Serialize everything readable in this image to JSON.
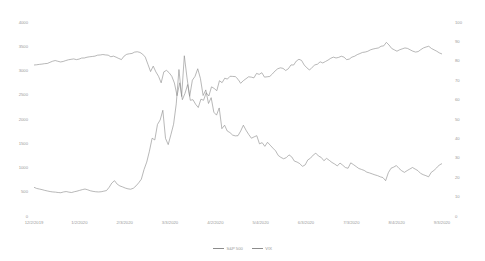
{
  "chart_data": {
    "type": "line",
    "title": "",
    "xlabel": "",
    "ylabel": "",
    "y2label": "",
    "grid": false,
    "legend_position": "bottom-center",
    "line_color": "#8c8c8c",
    "axis_text_color": "#9a9a9a",
    "x_tick_labels": [
      "12/2/2019",
      "1/2/2020",
      "2/3/2020",
      "3/3/2020",
      "4/2/2020",
      "5/4/2020",
      "6/3/2020",
      "7/3/2020",
      "8/4/2020",
      "9/3/2020"
    ],
    "y_left_ticks": [
      "4000",
      "3500",
      "3000",
      "2500",
      "2000",
      "1500",
      "1000",
      "500",
      "0"
    ],
    "y_left_lim": [
      0,
      4000
    ],
    "y_right_ticks": [
      "100",
      "90",
      "80",
      "70",
      "60",
      "50",
      "40",
      "30",
      "20",
      "10",
      "0"
    ],
    "y_right_lim": [
      0,
      100
    ],
    "series": [
      {
        "name": "S&P 500",
        "axis": "left",
        "values": [
          3113,
          3118,
          3126,
          3132,
          3141,
          3145,
          3168,
          3191,
          3205,
          3191,
          3176,
          3186,
          3205,
          3221,
          3230,
          3239,
          3224,
          3235,
          3257,
          3258,
          3274,
          3283,
          3289,
          3296,
          3316,
          3320,
          3329,
          3321,
          3316,
          3283,
          3296,
          3274,
          3248,
          3225,
          3297,
          3334,
          3345,
          3352,
          3380,
          3386,
          3373,
          3337,
          3276,
          3128,
          2978,
          3090,
          2972,
          2881,
          2746,
          2972,
          3003,
          2954,
          2882,
          2741,
          2480,
          2746,
          2398,
          2529,
          2711,
          2386,
          2398,
          2304,
          2237,
          2409,
          2386,
          2541,
          2475,
          2663,
          2630,
          2584,
          2789,
          2749,
          2842,
          2823,
          2881,
          2878,
          2874,
          2820,
          2736,
          2789,
          2830,
          2870,
          2863,
          2848,
          2940,
          2920,
          2954,
          2863,
          2870,
          2878,
          2930,
          2991,
          3036,
          3055,
          3044,
          3000,
          3036,
          3115,
          3113,
          3194,
          3232,
          3207,
          3113,
          3055,
          3009,
          3066,
          3115,
          3130,
          3179,
          3155,
          3185,
          3215,
          3252,
          3276,
          3258,
          3271,
          3294,
          3276,
          3224,
          3235,
          3276,
          3294,
          3327,
          3349,
          3373,
          3380,
          3397,
          3426,
          3443,
          3455,
          3465,
          3500,
          3508,
          3580,
          3526,
          3455,
          3426,
          3398,
          3427,
          3446,
          3465,
          3455,
          3426,
          3398,
          3380,
          3390,
          3430,
          3465,
          3485,
          3500,
          3455,
          3426,
          3398,
          3363,
          3340
        ]
      },
      {
        "name": "VIX",
        "axis": "right",
        "values": [
          14.8,
          14.2,
          13.9,
          13.6,
          13.2,
          12.9,
          12.6,
          12.4,
          12.3,
          12.1,
          12.0,
          12.4,
          12.6,
          12.3,
          12.1,
          12.5,
          12.8,
          13.2,
          13.6,
          13.9,
          13.5,
          13.0,
          12.7,
          12.5,
          12.4,
          12.5,
          12.8,
          13.1,
          14.8,
          17.0,
          18.2,
          16.4,
          15.5,
          15.0,
          14.4,
          14.0,
          13.8,
          14.3,
          15.5,
          17.1,
          19.0,
          24.0,
          27.8,
          33.4,
          40.1,
          39.2,
          47.2,
          49.5,
          54.5,
          40.0,
          36.8,
          41.9,
          47.3,
          57.8,
          75.5,
          61.6,
          82.6,
          71.2,
          61.7,
          70.0,
          72.0,
          75.9,
          70.9,
          62.1,
          65.0,
          58.0,
          61.0,
          53.5,
          52.0,
          55.7,
          45.0,
          46.8,
          43.8,
          43.0,
          41.7,
          41.3,
          41.4,
          43.8,
          46.8,
          44.2,
          42.0,
          40.1,
          40.8,
          41.4,
          37.2,
          37.8,
          35.9,
          38.0,
          36.5,
          35.0,
          33.6,
          31.2,
          30.2,
          29.5,
          30.1,
          31.5,
          30.5,
          28.3,
          27.8,
          27.0,
          25.6,
          26.3,
          28.9,
          29.8,
          31.4,
          32.4,
          30.9,
          30.2,
          28.5,
          29.7,
          28.7,
          27.6,
          26.8,
          25.8,
          27.3,
          26.2,
          25.0,
          24.6,
          27.4,
          26.5,
          25.5,
          24.5,
          24.0,
          23.5,
          22.6,
          22.2,
          21.7,
          21.2,
          20.8,
          20.2,
          19.8,
          18.2,
          22.3,
          24.6,
          25.2,
          26.0,
          24.5,
          23.3,
          22.5,
          23.4,
          24.2,
          25.0,
          24.2,
          23.4,
          22.0,
          21.3,
          20.8,
          20.2,
          22.5,
          23.5,
          24.8,
          26.3,
          27.0
        ]
      }
    ]
  },
  "legend": {
    "items": [
      {
        "label": "S&P 500"
      },
      {
        "label": "VIX"
      }
    ]
  }
}
